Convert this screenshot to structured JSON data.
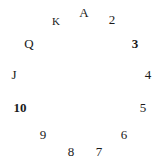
{
  "diagram": {
    "type": "radial-label-ring",
    "background_color": "#ffffff",
    "text_color": "#1a1a1a",
    "center": {
      "x": 81,
      "y": 84
    },
    "radius_x": 68,
    "radius_y": 68,
    "labels": [
      {
        "text": "A",
        "x": 84,
        "y": 12,
        "bold": false,
        "small": false
      },
      {
        "text": "2",
        "x": 112,
        "y": 19,
        "bold": false,
        "small": false
      },
      {
        "text": "3",
        "x": 135,
        "y": 43,
        "bold": true,
        "small": false
      },
      {
        "text": "4",
        "x": 148,
        "y": 74,
        "bold": false,
        "small": false
      },
      {
        "text": "5",
        "x": 143,
        "y": 107,
        "bold": false,
        "small": false
      },
      {
        "text": "6",
        "x": 124,
        "y": 134,
        "bold": false,
        "small": false
      },
      {
        "text": "7",
        "x": 99,
        "y": 151,
        "bold": false,
        "small": false
      },
      {
        "text": "8",
        "x": 71,
        "y": 151,
        "bold": false,
        "small": false
      },
      {
        "text": "9",
        "x": 43,
        "y": 134,
        "bold": false,
        "small": false
      },
      {
        "text": "10",
        "x": 20,
        "y": 107,
        "bold": true,
        "small": false
      },
      {
        "text": "J",
        "x": 14,
        "y": 74,
        "bold": false,
        "small": false
      },
      {
        "text": "Q",
        "x": 29,
        "y": 43,
        "bold": false,
        "small": false
      },
      {
        "text": "K",
        "x": 56,
        "y": 21,
        "bold": false,
        "small": true
      }
    ]
  }
}
